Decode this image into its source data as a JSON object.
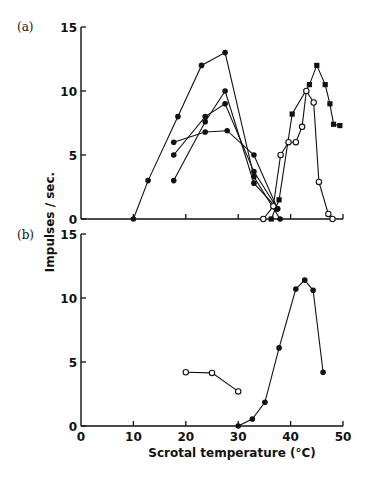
{
  "figure": {
    "ylabel": "Impulses / sec.",
    "xlabel": "Scrotal  temperature (°C)"
  },
  "chart_data": [
    {
      "type": "line",
      "panel": "(a)",
      "title": "",
      "xlabel": "Scrotal temperature (°C)",
      "ylabel": "Impulses / sec.",
      "xlim": [
        0,
        50
      ],
      "ylim": [
        0,
        15
      ],
      "xticks": [
        0,
        10,
        20,
        30,
        40,
        50
      ],
      "yticks": [
        0,
        5,
        10,
        15
      ],
      "grid": false,
      "series": [
        {
          "name": "cold unit 1",
          "marker": "filled-circle",
          "x": [
            10,
            12.8,
            18.5,
            23,
            27.5,
            33,
            38
          ],
          "y": [
            0,
            3,
            8,
            12,
            13,
            3.3,
            0
          ]
        },
        {
          "name": "cold unit 2",
          "marker": "filled-circle",
          "x": [
            17.7,
            23.7,
            27.9,
            33,
            37.5
          ],
          "y": [
            6,
            6.8,
            6.9,
            5,
            0.8
          ]
        },
        {
          "name": "cold unit 3",
          "marker": "filled-circle",
          "x": [
            17.7,
            23.7,
            27.5,
            33,
            37.5
          ],
          "y": [
            5,
            8,
            9,
            3.7,
            0.8
          ]
        },
        {
          "name": "cold unit 4",
          "marker": "filled-circle",
          "x": [
            17.7,
            23.7,
            27.5,
            33,
            37.5
          ],
          "y": [
            3,
            7.6,
            10,
            2.8,
            0.8
          ]
        },
        {
          "name": "warm unit (filled)",
          "marker": "filled-square",
          "x": [
            36.3,
            37.8,
            40.3,
            43.6,
            45,
            46.6,
            47.5,
            48.2,
            49.4
          ],
          "y": [
            0,
            1.5,
            8.2,
            10.5,
            12,
            10.5,
            9,
            7.4,
            7.3
          ]
        },
        {
          "name": "warm unit (open)",
          "marker": "open-circle",
          "x": [
            34.8,
            36.7,
            38.1,
            39.6,
            41,
            42.2,
            43,
            44.4,
            45.4,
            47.2,
            48
          ],
          "y": [
            0,
            1,
            5,
            6,
            6,
            7.2,
            10,
            9.1,
            2.9,
            0.4,
            0
          ]
        }
      ]
    },
    {
      "type": "line",
      "panel": "(b)",
      "title": "",
      "xlabel": "Scrotal temperature (°C)",
      "ylabel": "Impulses / sec.",
      "xlim": [
        0,
        50
      ],
      "ylim": [
        0,
        15
      ],
      "xticks": [
        0,
        10,
        20,
        30,
        40,
        50
      ],
      "yticks": [
        0,
        5,
        10,
        15
      ],
      "grid": false,
      "series": [
        {
          "name": "open",
          "marker": "open-circle",
          "x": [
            20,
            25,
            30
          ],
          "y": [
            4.2,
            4.15,
            2.7
          ]
        },
        {
          "name": "filled",
          "marker": "filled-circle",
          "x": [
            30,
            32.7,
            35.1,
            37.8,
            41,
            42.7,
            44.3,
            46.2
          ],
          "y": [
            0,
            0.55,
            1.85,
            6.1,
            10.7,
            11.4,
            10.6,
            4.2
          ]
        }
      ]
    }
  ],
  "layout": {
    "x0": 81,
    "pxPerX": 5.24,
    "panels": [
      {
        "y0": 219,
        "pxPerY": 12.8,
        "labelX": 17,
        "labelY": 31
      },
      {
        "y0": 426,
        "pxPerY": 12.8,
        "labelX": 17,
        "labelY": 239
      }
    ],
    "axisEndX": 343,
    "color": "#111111"
  }
}
